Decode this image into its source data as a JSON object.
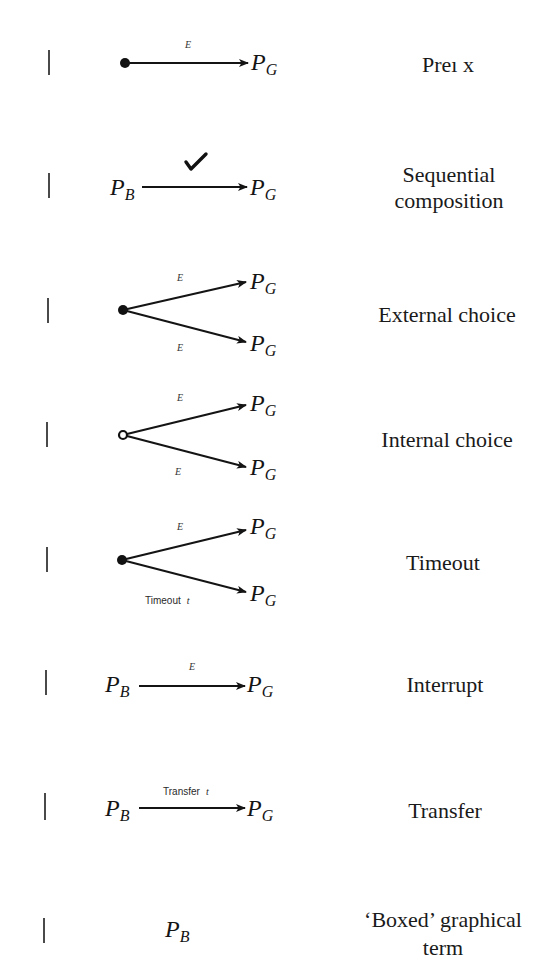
{
  "figure": {
    "kind": "graphical-notation-table",
    "rows": [
      {
        "name": "prefix",
        "label_lines": [
          "Preı x"
        ],
        "source": {
          "kind": "filled-dot"
        },
        "branches": [
          {
            "event": "E",
            "target": {
              "base": "P",
              "sub": "G"
            }
          }
        ]
      },
      {
        "name": "sequential-composition",
        "label_lines": [
          "Sequential",
          "composition"
        ],
        "source": {
          "kind": "term",
          "base": "P",
          "sub": "B"
        },
        "branches": [
          {
            "event_icon": "checkmark-icon",
            "target": {
              "base": "P",
              "sub": "G"
            }
          }
        ]
      },
      {
        "name": "external-choice",
        "label_lines": [
          "External choice"
        ],
        "source": {
          "kind": "filled-dot"
        },
        "branches": [
          {
            "event": "E",
            "target": {
              "base": "P",
              "sub": "G"
            }
          },
          {
            "event": "E",
            "target": {
              "base": "P",
              "sub": "G"
            }
          }
        ]
      },
      {
        "name": "internal-choice",
        "label_lines": [
          "Internal choice"
        ],
        "source": {
          "kind": "open-circle"
        },
        "branches": [
          {
            "event": "E",
            "target": {
              "base": "P",
              "sub": "G"
            }
          },
          {
            "event": "E",
            "target": {
              "base": "P",
              "sub": "G"
            }
          }
        ]
      },
      {
        "name": "timeout",
        "label_lines": [
          "Timeout"
        ],
        "source": {
          "kind": "filled-dot"
        },
        "branches": [
          {
            "event": "E",
            "target": {
              "base": "P",
              "sub": "G"
            }
          },
          {
            "event_text": "Timeout",
            "event_param": "t",
            "target": {
              "base": "P",
              "sub": "G"
            }
          }
        ]
      },
      {
        "name": "interrupt",
        "label_lines": [
          "Interrupt"
        ],
        "source": {
          "kind": "term",
          "base": "P",
          "sub": "B"
        },
        "branches": [
          {
            "event": "E",
            "target": {
              "base": "P",
              "sub": "G"
            }
          }
        ]
      },
      {
        "name": "transfer",
        "label_lines": [
          "Transfer"
        ],
        "source": {
          "kind": "term",
          "base": "P",
          "sub": "B"
        },
        "branches": [
          {
            "event_text": "Transfer",
            "event_param": "t",
            "target": {
              "base": "P",
              "sub": "G"
            }
          }
        ]
      },
      {
        "name": "boxed-graphical-term",
        "label_lines": [
          "‘Boxed’ graphical",
          "term"
        ],
        "source": {
          "kind": "term",
          "base": "P",
          "sub": "B"
        },
        "branches": []
      }
    ],
    "colors": {
      "ink": "#141414",
      "bar": "#4a4a4a",
      "background": "#ffffff"
    }
  }
}
